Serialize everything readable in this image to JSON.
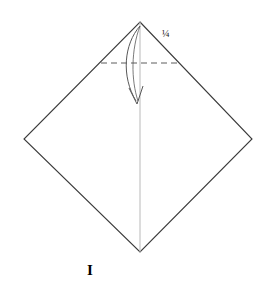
{
  "figure": {
    "domain": "diagram",
    "kind": "origami-fold-step",
    "background_color": "#ffffff",
    "line_color": "#3a3a3a",
    "guide_color": "#b9b9b9",
    "arrow_color": "#585858",
    "text_color": "#1a1a1a",
    "canvas": {
      "width": 268,
      "height": 295
    }
  },
  "labels": {
    "fraction": "¼",
    "step": "I"
  },
  "shape": {
    "name": "square-rotated-45",
    "vertices": {
      "top": {
        "x": 140,
        "y": 22
      },
      "right": {
        "x": 252,
        "y": 139
      },
      "bottom": {
        "x": 140,
        "y": 252
      },
      "left": {
        "x": 24,
        "y": 139
      }
    }
  },
  "center_line": {
    "name": "vertical-center-crease",
    "x1": 140,
    "y1": 22,
    "x2": 140,
    "y2": 252,
    "style": "solid-thin-light"
  },
  "fold_line": {
    "name": "horizontal-quarter-fold",
    "x1": 101,
    "y1": 63,
    "x2": 178,
    "y2": 63,
    "style": "dashed",
    "dash_pattern": "6 4"
  },
  "fold_arrow": {
    "name": "valley-fold-arrow",
    "start": {
      "x": 140,
      "y": 26
    },
    "end": {
      "x": 137,
      "y": 103
    },
    "bow_direction": "left",
    "head": "open-v"
  }
}
